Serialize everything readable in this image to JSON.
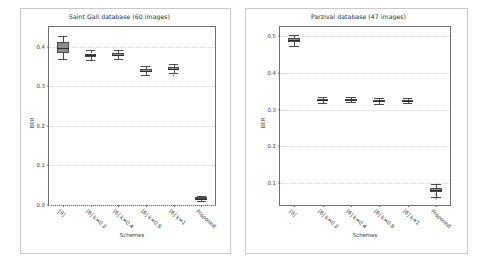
{
  "figure": {
    "width": 478,
    "height": 262,
    "background": "#ffffff",
    "frame_color": "#c9c9c9",
    "axes_color": "#6f6f6f",
    "box_fill": "#8c8c8c",
    "box_edge": "#4a4a4a"
  },
  "chart_data": [
    {
      "type": "box",
      "title": "Saint Gall database (60 images)",
      "xlabel": "Schemes",
      "ylabel": "BER",
      "grid": true,
      "legend": "none",
      "ylim": [
        0.0,
        0.45
      ],
      "yticks": [
        0.0,
        0.1,
        0.2,
        0.3,
        0.4
      ],
      "ytick_labels": [
        "0.0",
        "0.1",
        "0.2",
        "0.3",
        "0.4"
      ],
      "categories": [
        "[9]",
        "[6] k=0.2",
        "[6] k=0.4",
        "[6] k=0.8",
        "[6] k=1",
        "Proposed"
      ],
      "boxes": [
        {
          "category": "[9]",
          "whisker_low": 0.368,
          "q1": 0.385,
          "median": 0.398,
          "q3": 0.412,
          "whisker_high": 0.428,
          "fliers": []
        },
        {
          "category": "[6] k=0.2",
          "whisker_low": 0.366,
          "q1": 0.374,
          "median": 0.379,
          "q3": 0.383,
          "whisker_high": 0.392,
          "fliers": []
        },
        {
          "category": "[6] k=0.4",
          "whisker_low": 0.369,
          "q1": 0.376,
          "median": 0.38,
          "q3": 0.385,
          "whisker_high": 0.392,
          "fliers": []
        },
        {
          "category": "[6] k=0.8",
          "whisker_low": 0.329,
          "q1": 0.337,
          "median": 0.34,
          "q3": 0.344,
          "whisker_high": 0.352,
          "fliers": []
        },
        {
          "category": "[6] k=1",
          "whisker_low": 0.334,
          "q1": 0.342,
          "median": 0.345,
          "q3": 0.349,
          "whisker_high": 0.357,
          "fliers": [
            0.327
          ]
        },
        {
          "category": "Proposed",
          "whisker_low": 0.01,
          "q1": 0.014,
          "median": 0.016,
          "q3": 0.019,
          "whisker_high": 0.023,
          "fliers": []
        }
      ]
    },
    {
      "type": "box",
      "title": "Parzival database (47 images)",
      "xlabel": "Schemes",
      "ylabel": "BER",
      "grid": true,
      "legend": "none",
      "ylim": [
        0.04,
        0.525
      ],
      "yticks": [
        0.1,
        0.2,
        0.3,
        0.4,
        0.5
      ],
      "ytick_labels": [
        "0.1",
        "0.2",
        "0.3",
        "0.4",
        "0.5"
      ],
      "categories": [
        "[9]",
        "[6] k=0.2",
        "[6] k=0.4",
        "[6] k=0.8",
        "[6] k=1",
        "Proposed"
      ],
      "boxes": [
        {
          "category": "[9]",
          "whisker_low": 0.474,
          "q1": 0.485,
          "median": 0.49,
          "q3": 0.494,
          "whisker_high": 0.504,
          "fliers": []
        },
        {
          "category": "[6] k=0.2",
          "whisker_low": 0.319,
          "q1": 0.324,
          "median": 0.326,
          "q3": 0.328,
          "whisker_high": 0.333,
          "fliers": []
        },
        {
          "category": "[6] k=0.4",
          "whisker_low": 0.32,
          "q1": 0.324,
          "median": 0.326,
          "q3": 0.328,
          "whisker_high": 0.333,
          "fliers": []
        },
        {
          "category": "[6] k=0.8",
          "whisker_low": 0.315,
          "q1": 0.321,
          "median": 0.323,
          "q3": 0.326,
          "whisker_high": 0.331,
          "fliers": []
        },
        {
          "category": "[6] k=1",
          "whisker_low": 0.317,
          "q1": 0.322,
          "median": 0.324,
          "q3": 0.327,
          "whisker_high": 0.332,
          "fliers": []
        },
        {
          "category": "Proposed",
          "whisker_low": 0.062,
          "q1": 0.075,
          "median": 0.081,
          "q3": 0.087,
          "whisker_high": 0.098,
          "fliers": [
            0.068,
            0.056
          ]
        }
      ]
    }
  ]
}
